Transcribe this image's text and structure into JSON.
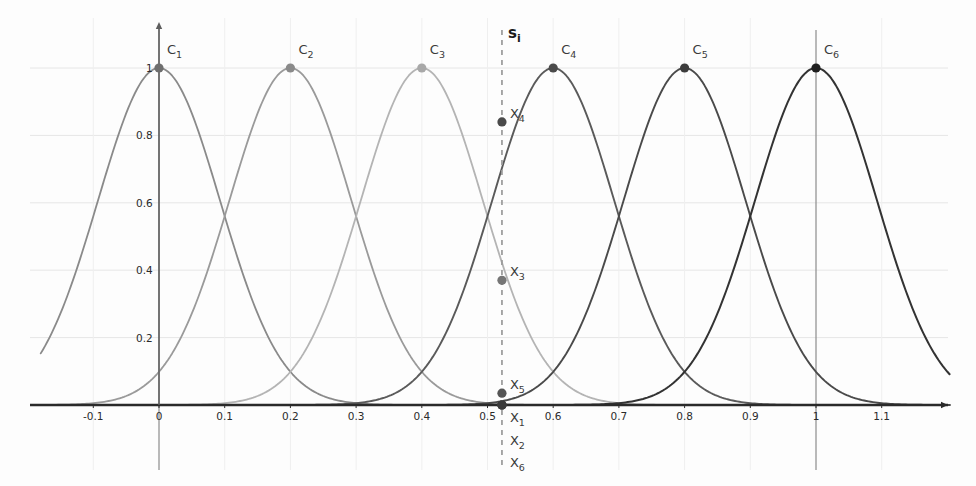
{
  "chart_data": {
    "type": "line",
    "title": "",
    "xlabel": "",
    "ylabel": "",
    "xlim": [
      -0.18,
      1.22
    ],
    "ylim": [
      -0.12,
      1.12
    ],
    "grid": true,
    "legend": "none",
    "x_ticks": [
      "-0.1",
      "0",
      "0.1",
      "0.2",
      "0.3",
      "0.4",
      "0.5",
      "0.6",
      "0.7",
      "0.8",
      "0.9",
      "1",
      "1.1"
    ],
    "x_tick_values": [
      -0.1,
      0,
      0.1,
      0.2,
      0.3,
      0.4,
      0.5,
      0.6,
      0.7,
      0.8,
      0.9,
      1.0,
      1.1
    ],
    "y_ticks": [
      "0.2",
      "0.4",
      "0.6",
      "0.8",
      "1"
    ],
    "y_tick_values": [
      0.2,
      0.4,
      0.6,
      0.8,
      1.0
    ],
    "series": [
      {
        "name": "C1",
        "center": 0.0,
        "peak": 1.0,
        "width": 0.1314,
        "color": "#8a8a8a",
        "stroke_width": 1.8
      },
      {
        "name": "C2",
        "center": 0.2,
        "peak": 1.0,
        "width": 0.1314,
        "color": "#9a9a9a",
        "stroke_width": 1.8
      },
      {
        "name": "C3",
        "center": 0.4,
        "peak": 1.0,
        "width": 0.1314,
        "color": "#b4b4b4",
        "stroke_width": 1.8
      },
      {
        "name": "C4",
        "center": 0.6,
        "peak": 1.0,
        "width": 0.1314,
        "color": "#5a5a5a",
        "stroke_width": 1.9
      },
      {
        "name": "C5",
        "center": 0.8,
        "peak": 1.0,
        "width": 0.1314,
        "color": "#4a4a4a",
        "stroke_width": 1.9
      },
      {
        "name": "C6",
        "center": 1.0,
        "peak": 1.0,
        "width": 0.1314,
        "color": "#333333",
        "stroke_width": 2.0
      }
    ],
    "center_points": [
      {
        "label": "C1",
        "sub": "1",
        "x": 0.0,
        "y": 1.0,
        "color": "#6e6e6e"
      },
      {
        "label": "C2",
        "sub": "2",
        "x": 0.2,
        "y": 1.0,
        "color": "#8a8a8a"
      },
      {
        "label": "C3",
        "sub": "3",
        "x": 0.4,
        "y": 1.0,
        "color": "#a8a8a8"
      },
      {
        "label": "C4",
        "sub": "4",
        "x": 0.6,
        "y": 1.0,
        "color": "#4a4a4a"
      },
      {
        "label": "C5",
        "sub": "5",
        "x": 0.8,
        "y": 1.0,
        "color": "#3c3c3c"
      },
      {
        "label": "C6",
        "sub": "6",
        "x": 1.0,
        "y": 1.0,
        "color": "#1f1f1f"
      }
    ],
    "sample_line": {
      "label": "s",
      "sub": "i",
      "x": 0.522,
      "style": "dashed",
      "color": "#9a9a9a"
    },
    "activation_points": [
      {
        "label": "X",
        "sub": "4",
        "x": 0.522,
        "y": 0.84,
        "color": "#4a4a4a",
        "shown_inline": true
      },
      {
        "label": "X",
        "sub": "3",
        "x": 0.522,
        "y": 0.37,
        "color": "#767676",
        "shown_inline": true
      },
      {
        "label": "X",
        "sub": "5",
        "x": 0.522,
        "y": 0.035,
        "color": "#555555",
        "shown_inline": true
      },
      {
        "label": "X",
        "sub": "1",
        "x": 0.522,
        "y": 0.0,
        "color": "#3a3a3a",
        "shown_inline": false
      },
      {
        "label": "X",
        "sub": "2",
        "x": 0.522,
        "y": 0.0,
        "color": "#3a3a3a",
        "shown_inline": false
      },
      {
        "label": "X",
        "sub": "6",
        "x": 0.522,
        "y": 0.0,
        "color": "#3a3a3a",
        "shown_inline": false
      }
    ],
    "axis_color": "#2a2a2a",
    "grid_color": "#e6e6e6",
    "vertical_rule_color": "#8c8c8c",
    "vertical_rules": [
      0.0,
      1.0
    ]
  }
}
